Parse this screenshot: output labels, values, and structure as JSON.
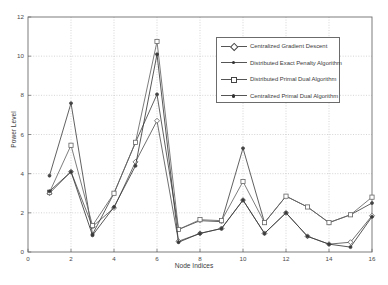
{
  "chart_data": {
    "type": "line",
    "title": "",
    "xlabel": "Node Indices",
    "ylabel": "Power Level",
    "xlim": [
      0,
      16
    ],
    "ylim": [
      0,
      12
    ],
    "xticks": [
      0,
      2,
      4,
      6,
      8,
      10,
      12,
      14,
      16
    ],
    "yticks": [
      0,
      2,
      4,
      6,
      8,
      10,
      12
    ],
    "xtick_labels": [
      "0",
      "2",
      "4",
      "6",
      "8",
      "10",
      "12",
      "14",
      "16"
    ],
    "ytick_labels": [
      "0",
      "2",
      "4",
      "6",
      "8",
      "10",
      "12"
    ],
    "grid": true,
    "legend_position": "upper right",
    "x": [
      1,
      2,
      3,
      4,
      5,
      6,
      7,
      8,
      9,
      10,
      11,
      12,
      13,
      14,
      15,
      16
    ],
    "series": [
      {
        "name": "Centralized Gradient Descent",
        "marker": "diamond",
        "color": "#555555",
        "values": [
          3.0,
          4.1,
          1.3,
          2.25,
          4.6,
          6.7,
          0.55,
          0.95,
          1.2,
          2.65,
          0.95,
          2.0,
          0.8,
          0.4,
          0.5,
          1.85
        ]
      },
      {
        "name": "Distributed Exact Penalty Algorithm",
        "marker": "dot",
        "color": "#444444",
        "values": [
          3.9,
          7.6,
          0.9,
          3.0,
          5.6,
          8.05,
          1.15,
          1.6,
          1.55,
          5.3,
          1.5,
          2.85,
          2.3,
          1.5,
          1.9,
          2.5
        ]
      },
      {
        "name": "Distributed Primal Dual Algorithm",
        "marker": "square",
        "color": "#666666",
        "values": [
          3.05,
          5.45,
          1.35,
          3.0,
          5.6,
          10.75,
          1.15,
          1.65,
          1.6,
          3.6,
          1.5,
          2.85,
          2.3,
          1.5,
          1.9,
          2.8
        ]
      },
      {
        "name": "Centralized Primal Dual Algorithm",
        "marker": "star",
        "color": "#3a3a3a",
        "values": [
          3.1,
          4.1,
          0.85,
          2.3,
          4.4,
          10.1,
          0.5,
          0.95,
          1.2,
          2.65,
          0.95,
          2.0,
          0.8,
          0.4,
          0.25,
          1.8
        ]
      }
    ]
  },
  "legend": {
    "items": [
      {
        "label": "Centralized Gradient Descent",
        "marker": "diamond-marker"
      },
      {
        "label": "Distributed Exact Penalty Algorithm",
        "marker": "dot-marker"
      },
      {
        "label": "Distributed Primal Dual Algorithm",
        "marker": "square-marker"
      },
      {
        "label": "Centralized Primal Dual Algorithm",
        "marker": "star-marker"
      }
    ]
  }
}
